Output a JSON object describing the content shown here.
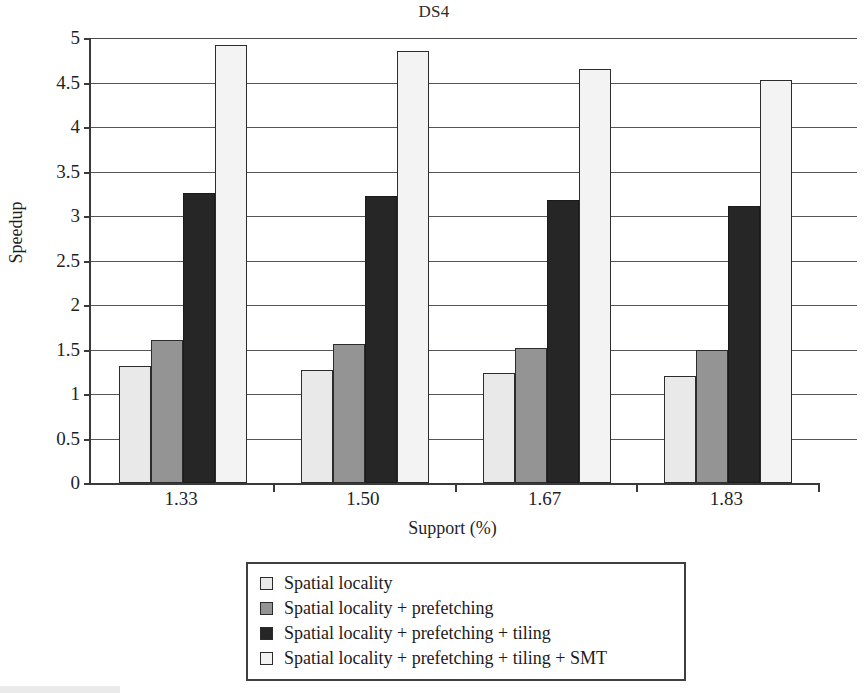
{
  "chart_data": {
    "type": "bar",
    "title": "DS4",
    "xlabel": "Support (%)",
    "ylabel": "Speedup",
    "categories": [
      "1.33",
      "1.50",
      "1.67",
      "1.83"
    ],
    "ylim": [
      0,
      5
    ],
    "yticks": [
      0,
      0.5,
      1,
      1.5,
      2,
      2.5,
      3,
      3.5,
      4,
      4.5,
      5
    ],
    "ytick_labels": [
      "0",
      "0.5",
      "1",
      "1.5",
      "2",
      "2.5",
      "3",
      "3.5",
      "4",
      "4.5",
      "5"
    ],
    "grid": true,
    "legend_position": "bottom",
    "series": [
      {
        "name": "Spatial locality",
        "color": "#e9e9e9",
        "values": [
          1.31,
          1.27,
          1.24,
          1.2
        ]
      },
      {
        "name": "Spatial locality + prefetching",
        "color": "#949494",
        "values": [
          1.61,
          1.56,
          1.52,
          1.5
        ]
      },
      {
        "name": "Spatial locality + prefetching + tiling",
        "color": "#262626",
        "values": [
          3.26,
          3.23,
          3.18,
          3.11
        ]
      },
      {
        "name": "Spatial locality + prefetching + tiling + SMT",
        "color": "#f3f3f3",
        "values": [
          4.92,
          4.85,
          4.65,
          4.53
        ]
      }
    ]
  },
  "legend": {
    "entries": [
      "Spatial locality",
      "Spatial locality + prefetching",
      "Spatial locality + prefetching + tiling",
      "Spatial locality + prefetching + tiling + SMT"
    ]
  }
}
